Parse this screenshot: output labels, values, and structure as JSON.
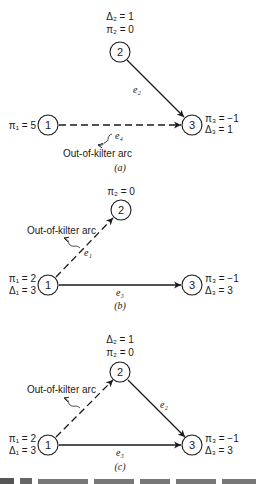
{
  "figure": {
    "panels": [
      {
        "caption": "(a)",
        "nodes": [
          {
            "id": "1",
            "labels": [
              "π₁ = 5"
            ]
          },
          {
            "id": "2",
            "labels": [
              "Δ₂ = 1",
              "π₂ = 0"
            ]
          },
          {
            "id": "3",
            "labels": [
              "π₃ = −1",
              "Δ₃ = 1"
            ]
          }
        ],
        "arcs": [
          {
            "id": "e2",
            "label": "e₂",
            "from": "2",
            "to": "3",
            "style": "solid"
          },
          {
            "id": "e4",
            "label": "e₄",
            "from": "1",
            "to": "3",
            "style": "dashed"
          }
        ],
        "annotation": "Out-of-kilter arc"
      },
      {
        "caption": "(b)",
        "nodes": [
          {
            "id": "1",
            "labels": [
              "π₁ = 2",
              "Δ₁ = 3"
            ]
          },
          {
            "id": "2",
            "labels": [
              "π₂ = 0"
            ]
          },
          {
            "id": "3",
            "labels": [
              "π₃ = −1",
              "Δ₃ = 3"
            ]
          }
        ],
        "arcs": [
          {
            "id": "e1",
            "label": "e₁",
            "from": "1",
            "to": "2",
            "style": "dashed"
          },
          {
            "id": "e3",
            "label": "e₃",
            "from": "1",
            "to": "3",
            "style": "solid"
          }
        ],
        "annotation": "Out-of-kilter arc"
      },
      {
        "caption": "(c)",
        "nodes": [
          {
            "id": "1",
            "labels": [
              "π₁ = 2",
              "Δ₁ = 3"
            ]
          },
          {
            "id": "2",
            "labels": [
              "Δ₂ = 1",
              "π₂ = 0"
            ]
          },
          {
            "id": "3",
            "labels": [
              "π₃ = −1",
              "Δ₃ = 3"
            ]
          }
        ],
        "arcs": [
          {
            "id": "e1",
            "label": "",
            "from": "1",
            "to": "2",
            "style": "dashed"
          },
          {
            "id": "e2",
            "label": "e₂",
            "from": "2",
            "to": "3",
            "style": "solid"
          },
          {
            "id": "e3",
            "label": "e₃",
            "from": "1",
            "to": "3",
            "style": "solid"
          }
        ],
        "annotation": "Out-of-kilter arc"
      }
    ],
    "truncated_caption": "F.13 Ex ... (caption cut off)"
  }
}
